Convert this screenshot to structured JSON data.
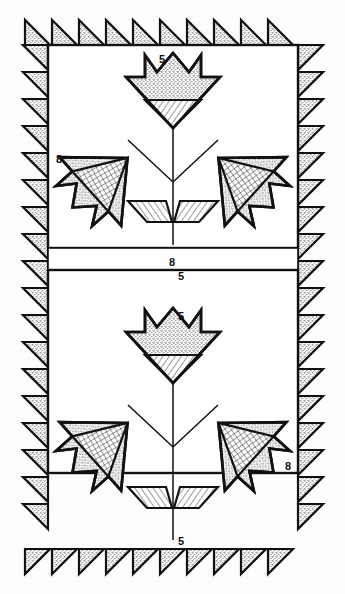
{
  "diagram": {
    "type": "quilt-pattern-schematic",
    "canvas": {
      "width": 345,
      "height": 594
    },
    "colors": {
      "ink": "#111111",
      "paper": "#fdfdfc",
      "stipple": "#cfcfcf",
      "hatch": "#e2e2e2"
    }
  },
  "labels": {
    "top_panel_flower_top": "5",
    "top_panel_stem_bottom": "5",
    "top_panel_left_side": "8",
    "center_sash": "8",
    "bottom_panel_flower_top": "5",
    "bottom_panel_stem_bottom": "5",
    "bottom_panel_right_side": "8"
  },
  "geometry": {
    "border": {
      "sawtooth_triangle_count_top": 10,
      "sawtooth_triangle_count_bottom": 10,
      "sawtooth_triangle_count_left_upper": 9,
      "sawtooth_triangle_count_left_lower": 9,
      "sawtooth_triangle_count_right_upper": 9,
      "sawtooth_triangle_count_right_lower": 9,
      "tooth_size": 25,
      "fill": "stipple"
    },
    "panels": [
      {
        "name": "top-panel",
        "x": 48,
        "y": 45,
        "width": 250,
        "height": 203
      },
      {
        "name": "center-sash",
        "x": 48,
        "y": 248,
        "width": 250,
        "height": 22
      },
      {
        "name": "bottom-panel",
        "x": 48,
        "y": 270,
        "width": 250,
        "height": 203
      }
    ],
    "motifs": [
      {
        "name": "center-tulip",
        "orientation": "up",
        "fill_top": "stipple",
        "fill_base": "hatch"
      },
      {
        "name": "left-tulip",
        "orientation": "diagonal-left",
        "fill_top": "stipple",
        "fill_base": "crosshatch"
      },
      {
        "name": "right-tulip",
        "orientation": "diagonal-right",
        "fill_top": "stipple",
        "fill_base": "hatch"
      },
      {
        "name": "leaf-pair",
        "orientation": "v-shape",
        "fill": "hatch"
      }
    ]
  }
}
